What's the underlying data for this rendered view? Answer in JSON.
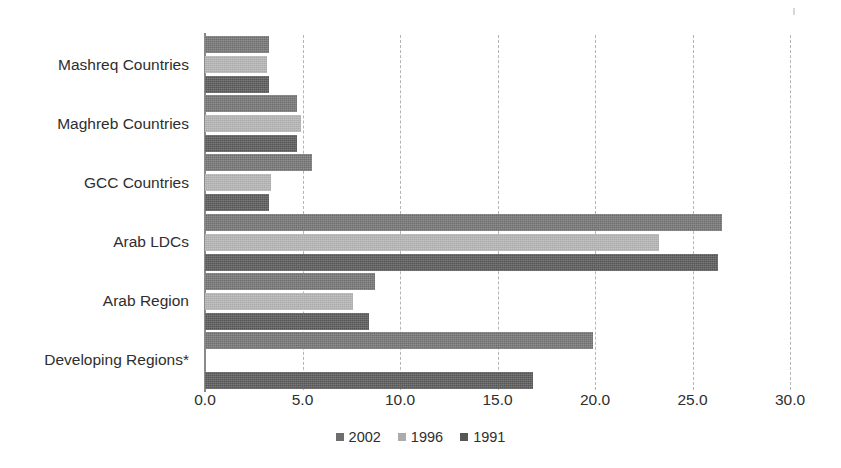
{
  "chart_data": {
    "type": "bar",
    "orientation": "horizontal",
    "title": "",
    "subtitle": "",
    "xlabel": "",
    "ylabel": "",
    "xlim": [
      0.0,
      30.0
    ],
    "xticks": [
      "0.0",
      "5.0",
      "10.0",
      "15.0",
      "20.0",
      "25.0",
      "30.0"
    ],
    "xtick_values": [
      0.0,
      5.0,
      10.0,
      15.0,
      20.0,
      25.0,
      30.0
    ],
    "grid": "vertical-dashed",
    "legend_position": "bottom-center",
    "categories": [
      "Mashreq Countries",
      "Maghreb Countries",
      "GCC Countries",
      "Arab LDCs",
      "Arab Region",
      "Developing Regions*"
    ],
    "series": [
      {
        "name": "2002",
        "color": "#6e6e6e",
        "values": [
          3.3,
          4.7,
          5.5,
          26.5,
          8.7,
          19.9
        ]
      },
      {
        "name": "1996",
        "color": "#ababab",
        "values": [
          3.2,
          4.9,
          3.4,
          23.3,
          7.6,
          null
        ]
      },
      {
        "name": "1991",
        "color": "#565656",
        "values": [
          3.3,
          4.7,
          3.3,
          26.3,
          8.4,
          16.8
        ]
      }
    ],
    "annotations": [
      "Developing Regions* has no 1996 data bar"
    ]
  },
  "legend": {
    "items": [
      {
        "label": "2002",
        "series_key": "y2002"
      },
      {
        "label": "1996",
        "series_key": "y1996"
      },
      {
        "label": "1991",
        "series_key": "y1991"
      }
    ]
  }
}
